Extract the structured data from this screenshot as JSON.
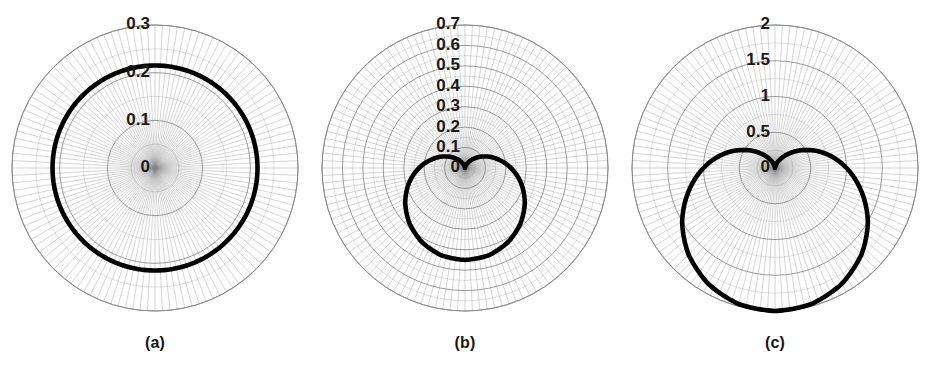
{
  "figure": {
    "title": "",
    "background_color": "#ffffff",
    "panel_count": 3
  },
  "panels": [
    {
      "caption": "(a)",
      "tick_labels": [
        "0.3",
        "0.2",
        "0.1",
        "0"
      ],
      "curve_color": "#000000",
      "grid_color": "#8a8a8a"
    },
    {
      "caption": "(b)",
      "tick_labels": [
        "0.7",
        "0.6",
        "0.5",
        "0.4",
        "0.3",
        "0.2",
        "0.1",
        "0"
      ],
      "curve_color": "#000000",
      "grid_color": "#8a8a8a"
    },
    {
      "caption": "(c)",
      "tick_labels": [
        "2",
        "1.5",
        "1",
        "0.5",
        "0"
      ],
      "curve_color": "#000000",
      "grid_color": "#8a8a8a"
    }
  ],
  "chart_data": [
    {
      "type": "line",
      "subtype": "polar",
      "title": "(a)",
      "xlabel": "",
      "ylabel": "",
      "rlim": [
        0,
        0.3
      ],
      "rticks": [
        0,
        0.1,
        0.2,
        0.3
      ],
      "rtick_labels": [
        "0",
        "0.1",
        "0.2",
        "0.3"
      ],
      "grid": true,
      "legend": "none",
      "theta_zero_location": "N",
      "theta_direction": "clockwise",
      "series": [
        {
          "name": "pattern-a",
          "description": "near-circular omnidirectional polar pattern at approximately r = 0.215",
          "theta_deg": [
            0,
            15,
            30,
            45,
            60,
            75,
            90,
            105,
            120,
            135,
            150,
            165,
            180,
            195,
            210,
            225,
            240,
            255,
            270,
            285,
            300,
            315,
            330,
            345,
            360
          ],
          "r": [
            0.215,
            0.215,
            0.215,
            0.215,
            0.215,
            0.215,
            0.215,
            0.215,
            0.215,
            0.215,
            0.215,
            0.215,
            0.215,
            0.215,
            0.215,
            0.215,
            0.215,
            0.215,
            0.215,
            0.215,
            0.215,
            0.215,
            0.215,
            0.215,
            0.215
          ]
        }
      ]
    },
    {
      "type": "line",
      "subtype": "polar",
      "title": "(b)",
      "xlabel": "",
      "ylabel": "",
      "rlim": [
        0,
        0.7
      ],
      "rticks": [
        0,
        0.1,
        0.2,
        0.3,
        0.4,
        0.5,
        0.6,
        0.7
      ],
      "rtick_labels": [
        "0",
        "0.1",
        "0.2",
        "0.3",
        "0.4",
        "0.5",
        "0.6",
        "0.7"
      ],
      "grid": true,
      "legend": "none",
      "theta_zero_location": "N",
      "theta_direction": "clockwise",
      "series": [
        {
          "name": "pattern-b",
          "description": "cardioid polar pattern with null toward 0 deg (up) and maximum toward 180 deg (down)",
          "theta_deg": [
            0,
            15,
            30,
            45,
            60,
            75,
            90,
            105,
            120,
            135,
            150,
            165,
            180,
            195,
            210,
            225,
            240,
            255,
            270,
            285,
            300,
            315,
            330,
            345,
            360
          ],
          "r": [
            0.0,
            0.008,
            0.03,
            0.066,
            0.113,
            0.166,
            0.225,
            0.284,
            0.338,
            0.384,
            0.42,
            0.443,
            0.45,
            0.443,
            0.42,
            0.384,
            0.338,
            0.284,
            0.225,
            0.166,
            0.113,
            0.066,
            0.03,
            0.008,
            0.0
          ]
        }
      ]
    },
    {
      "type": "line",
      "subtype": "polar",
      "title": "(c)",
      "xlabel": "",
      "ylabel": "",
      "rlim": [
        0,
        2
      ],
      "rticks": [
        0,
        0.5,
        1,
        1.5,
        2
      ],
      "rtick_labels": [
        "0",
        "0.5",
        "1",
        "1.5",
        "2"
      ],
      "grid": true,
      "legend": "none",
      "theta_zero_location": "N",
      "theta_direction": "clockwise",
      "series": [
        {
          "name": "pattern-c",
          "description": "narrow single-lobe directive pattern aimed toward 180 deg (down), peak r = 2",
          "theta_deg": [
            0,
            15,
            30,
            45,
            60,
            75,
            90,
            105,
            120,
            135,
            150,
            165,
            180,
            195,
            210,
            225,
            240,
            255,
            270,
            285,
            300,
            315,
            330,
            345,
            360
          ],
          "r": [
            0.0,
            0.03,
            0.13,
            0.29,
            0.5,
            0.75,
            1.0,
            1.25,
            1.5,
            1.71,
            1.87,
            1.97,
            2.0,
            1.97,
            1.87,
            1.71,
            1.5,
            1.25,
            1.0,
            0.75,
            0.5,
            0.29,
            0.13,
            0.03,
            0.0
          ]
        }
      ]
    }
  ]
}
